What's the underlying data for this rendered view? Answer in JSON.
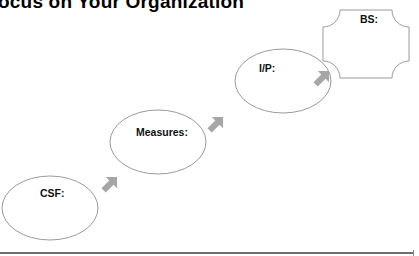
{
  "title": "ocus on Your Organization",
  "nodes": [
    {
      "id": "csf",
      "label": "CSF:",
      "shape": "ellipse"
    },
    {
      "id": "measures",
      "label": "Measures:",
      "shape": "ellipse"
    },
    {
      "id": "ip",
      "label": "I/P:",
      "shape": "ellipse"
    },
    {
      "id": "bs",
      "label": "BS:",
      "shape": "plaque"
    }
  ],
  "arrows": [
    {
      "from": "csf",
      "to": "measures",
      "direction": "up-right"
    },
    {
      "from": "measures",
      "to": "ip",
      "direction": "up-right"
    },
    {
      "from": "ip",
      "to": "bs",
      "direction": "up-right"
    }
  ],
  "colors": {
    "outline": "#9a9a9a",
    "arrow": "#a6a6a6",
    "rule": "#6e6e6e",
    "text": "#111111"
  }
}
